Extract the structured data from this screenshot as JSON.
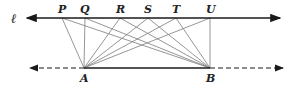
{
  "diagram": {
    "line_label": "ℓ",
    "top_points": [
      {
        "label": "P",
        "x": 62
      },
      {
        "label": "Q",
        "x": 85
      },
      {
        "label": "R",
        "x": 120
      },
      {
        "label": "S",
        "x": 148
      },
      {
        "label": "T",
        "x": 176
      },
      {
        "label": "U",
        "x": 210
      }
    ],
    "bottom_points": [
      {
        "label": "A",
        "x": 84
      },
      {
        "label": "B",
        "x": 210
      }
    ],
    "colors": {
      "line": "#1a1a1a",
      "segment": "#8a8a8a"
    }
  }
}
